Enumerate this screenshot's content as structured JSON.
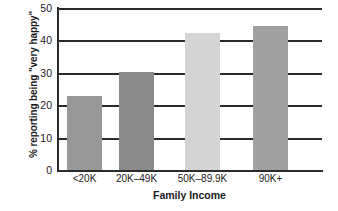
{
  "chart_data": {
    "type": "bar",
    "title": "",
    "xlabel": "Family Income",
    "ylabel": "% reporting being \"very happy\"",
    "categories": [
      "<20K",
      "20K–49K",
      "50K–89.9K",
      "90K+"
    ],
    "values": [
      22.7,
      30.3,
      42.4,
      44.5
    ],
    "series": [
      {
        "name": "% reporting being \"very happy\"",
        "values": [
          22.7,
          30.3,
          42.4,
          44.5
        ]
      }
    ],
    "bar_colors": [
      "#989898",
      "#8a8a8a",
      "#d4d4d4",
      "#a0a0a0"
    ],
    "ylim": [
      0,
      50
    ],
    "yticks": [
      0,
      10,
      20,
      30,
      40,
      50
    ],
    "ytick_labels": [
      "0",
      "10",
      "20",
      "30",
      "40",
      "50"
    ],
    "grid": true,
    "grid_axis": "y",
    "legend": "none",
    "axis_color": "#2b2b2b",
    "background": "#ffffff"
  }
}
